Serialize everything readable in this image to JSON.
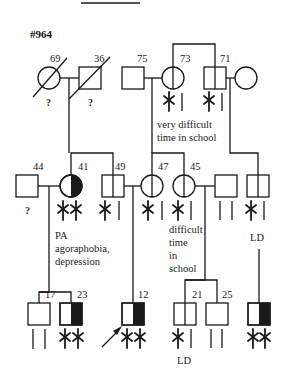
{
  "pedigree": {
    "id_label": "#964",
    "generation_1": {
      "individuals": [
        {
          "id": "I-1",
          "sex": "female",
          "age": "69",
          "deceased": true,
          "unknown_status": "?"
        },
        {
          "id": "I-2",
          "sex": "male",
          "age": "36",
          "deceased": true,
          "unknown_status": "?"
        },
        {
          "id": "I-3",
          "sex": "male",
          "age": "75"
        },
        {
          "id": "I-4",
          "sex": "female",
          "age": "73",
          "markers": [
            "star",
            "bar"
          ],
          "note": "very difficult time in school"
        },
        {
          "id": "I-5",
          "sex": "male",
          "age": "71",
          "markers": [
            "star",
            "bar"
          ]
        },
        {
          "id": "I-6",
          "sex": "female",
          "age": ""
        }
      ],
      "note_line1": "very difficult",
      "note_line2": "time in school"
    },
    "generation_2": {
      "individuals": [
        {
          "id": "II-1",
          "sex": "male",
          "age": "44",
          "unknown_status": "?"
        },
        {
          "id": "II-2",
          "sex": "female",
          "age": "41",
          "affected": "half",
          "markers": [
            "star",
            "star"
          ],
          "note": "PA agoraphobia, depression"
        },
        {
          "id": "II-3",
          "sex": "male",
          "age": "49",
          "markers": [
            "star",
            "bar"
          ]
        },
        {
          "id": "II-4",
          "sex": "female",
          "age": "47",
          "markers": [
            "star",
            "bar"
          ]
        },
        {
          "id": "II-5",
          "sex": "female",
          "age": "45",
          "markers": [
            "star",
            "bar"
          ],
          "note": "difficult time in school"
        },
        {
          "id": "II-6",
          "sex": "male",
          "age": "",
          "markers": [
            "bar",
            "bar"
          ]
        },
        {
          "id": "II-7",
          "sex": "male",
          "age": "",
          "markers": [
            "star",
            "bar"
          ],
          "note": "LD"
        }
      ],
      "note_pa_line1": "PA",
      "note_pa_line2": "agoraphobia,",
      "note_pa_line3": "depression",
      "note_diff_line1": "difficult",
      "note_diff_line2": "time",
      "note_diff_line3": "in",
      "note_diff_line4": "school",
      "note_ld": "LD"
    },
    "generation_3": {
      "individuals": [
        {
          "id": "III-1",
          "sex": "male",
          "age": "17",
          "markers": [
            "bar",
            "bar"
          ]
        },
        {
          "id": "III-2",
          "sex": "male",
          "age": "23",
          "affected": "half",
          "markers": [
            "star",
            "star"
          ]
        },
        {
          "id": "III-3",
          "sex": "male",
          "age": "12",
          "affected": "half",
          "proband": true,
          "markers": [
            "star",
            "star"
          ]
        },
        {
          "id": "III-4",
          "sex": "male",
          "age": "21",
          "markers": [
            "star",
            "bar"
          ],
          "note": "LD"
        },
        {
          "id": "III-5",
          "sex": "male",
          "age": "25",
          "markers": [
            "bar",
            "bar"
          ]
        },
        {
          "id": "III-6",
          "sex": "male",
          "age": "",
          "affected": "half",
          "markers": [
            "star",
            "star"
          ]
        }
      ],
      "note_ld": "LD"
    }
  }
}
